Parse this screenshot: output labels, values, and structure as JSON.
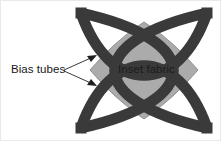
{
  "figure": {
    "width": 221,
    "height": 141,
    "background_color": "#ffffff",
    "border_color": "#e9e9e9",
    "type": "sewing-construction-diagram"
  },
  "motif": {
    "name": "quatrefoil-block",
    "bounds": {
      "x": 76,
      "y": 8,
      "width": 136,
      "height": 125
    },
    "tube_color": "#3a3a3a",
    "tube_outline_color": "#2b2b2b",
    "tube_width_px": 11,
    "inset_color": "#ababab",
    "inset_outline_color": "#8e8e8e",
    "arc_count": 4
  },
  "annotations": {
    "bias_tubes": {
      "label": "Bias tubes",
      "leader_color": "#3a3a3a",
      "arrow_count": 2,
      "arrow_targets": [
        {
          "x": 97,
          "y": 56
        },
        {
          "x": 97,
          "y": 85
        }
      ]
    },
    "inset_fabric": {
      "label": "Inset fabric"
    }
  }
}
